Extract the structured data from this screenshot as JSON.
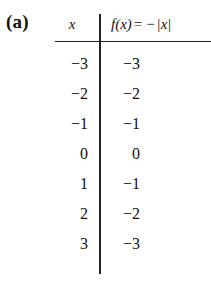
{
  "figure": {
    "part_label": "(a)"
  },
  "table": {
    "headers": {
      "x": "x",
      "fx_f": "f",
      "fx_paren_open": "(",
      "fx_var": "x",
      "fx_paren_close": ")",
      "fx_equals": "=",
      "fx_minus": "−",
      "fx_bar_left": "|",
      "fx_abs_var": "x",
      "fx_bar_right": "|",
      "fx_full": "f(x) = − |x|"
    },
    "rows": [
      {
        "x": "−3",
        "fx": "−3"
      },
      {
        "x": "−2",
        "fx": "−2"
      },
      {
        "x": "−1",
        "fx": "−1"
      },
      {
        "x": "0",
        "fx": "0"
      },
      {
        "x": "1",
        "fx": "−1"
      },
      {
        "x": "2",
        "fx": "−2"
      },
      {
        "x": "3",
        "fx": "−3"
      }
    ]
  },
  "colors": {
    "background": "#ffffff",
    "ink": "#111111",
    "rule": "#222222"
  }
}
